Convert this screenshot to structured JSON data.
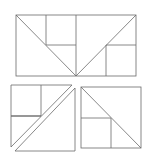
{
  "diagram": {
    "title": "",
    "line_color": "#6a6a6a",
    "background": "#ffffff",
    "figures": [
      {
        "name": "top-rectangle-dissection",
        "outline": [
          [
            16,
            15
          ],
          [
            136,
            15
          ],
          [
            136,
            76
          ],
          [
            16,
            76
          ]
        ],
        "segments": [
          [
            [
              16,
              15
            ],
            [
              76,
              76
            ]
          ],
          [
            [
              136,
              15
            ],
            [
              76,
              76
            ]
          ],
          [
            [
              46,
              15
            ],
            [
              46,
              45
            ]
          ],
          [
            [
              46,
              45
            ],
            [
              76,
              45
            ]
          ],
          [
            [
              76,
              15
            ],
            [
              76,
              76
            ]
          ],
          [
            [
              106,
              45
            ],
            [
              136,
              45
            ]
          ],
          [
            [
              106,
              45
            ],
            [
              106,
              76
            ]
          ]
        ]
      },
      {
        "name": "bottom-left-split-square",
        "pieces": [
          {
            "name": "upper-left-piece",
            "outline": [
              [
                11,
                85
              ],
              [
                72,
                85
              ],
              [
                11,
                147
              ]
            ],
            "segments": [
              [
                [
                  41,
                  85
                ],
                [
                  41,
                  116
                ]
              ],
              [
                [
                  11,
                  116
                ],
                [
                  41,
                  116
                ]
              ]
            ]
          },
          {
            "name": "lower-right-triangle",
            "outline": [
              [
                75,
                88
              ],
              [
                75,
                151
              ],
              [
                15,
                151
              ]
            ],
            "segments": []
          }
        ]
      },
      {
        "name": "bottom-right-square-dissection",
        "outline": [
          [
            81,
            87
          ],
          [
            141,
            87
          ],
          [
            141,
            148
          ],
          [
            81,
            148
          ]
        ],
        "segments": [
          [
            [
              81,
              87
            ],
            [
              141,
              148
            ]
          ],
          [
            [
              81,
              118
            ],
            [
              111,
              118
            ]
          ],
          [
            [
              111,
              118
            ],
            [
              111,
              148
            ]
          ]
        ]
      }
    ]
  }
}
